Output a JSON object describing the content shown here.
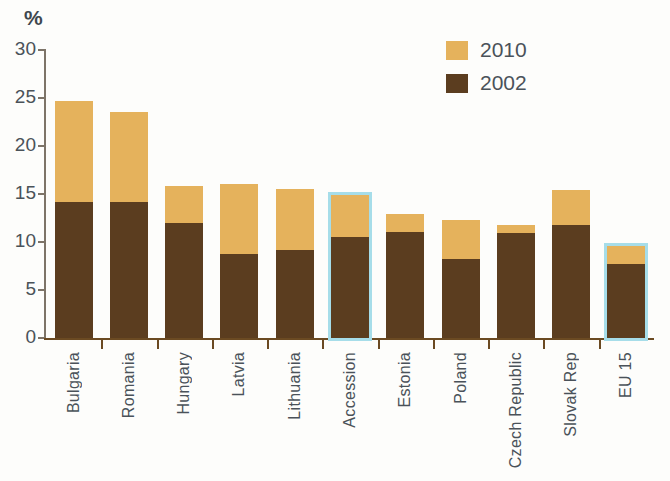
{
  "chart_data": {
    "type": "bar",
    "title": "",
    "subtitle": "",
    "xlabel": "",
    "ylabel": "%",
    "ylim": [
      0,
      30
    ],
    "yticks": [
      0,
      5,
      10,
      15,
      20,
      25,
      30
    ],
    "grid": false,
    "stacked": true,
    "legend_position": "top-right",
    "categories": [
      "Bulgaria",
      "Romania",
      "Hungary",
      "Latvia",
      "Lithuania",
      "Accession",
      "Estonia",
      "Poland",
      "Czech Republic",
      "Slovak Rep",
      "EU 15"
    ],
    "series": [
      {
        "name": "2002",
        "color": "#5b3d1f",
        "values": [
          14.2,
          14.2,
          12.0,
          8.8,
          9.2,
          10.5,
          11.0,
          8.2,
          10.9,
          11.8,
          7.7
        ]
      },
      {
        "name": "2010",
        "color": "#e5b25c",
        "values": [
          24.7,
          23.5,
          15.8,
          16.0,
          15.5,
          14.9,
          12.9,
          12.3,
          11.8,
          15.4,
          9.6
        ]
      }
    ],
    "highlighted_categories": [
      "Accession",
      "EU 15"
    ],
    "highlight_color": "#a6dde9"
  },
  "axes": {
    "y_unit": "%",
    "y_tick_labels": [
      "30",
      "25",
      "20",
      "15",
      "10",
      "5",
      "0"
    ]
  },
  "legend": {
    "entries": [
      {
        "label": "2010",
        "color": "#e5b25c"
      },
      {
        "label": "2002",
        "color": "#5b3d1f"
      }
    ]
  }
}
